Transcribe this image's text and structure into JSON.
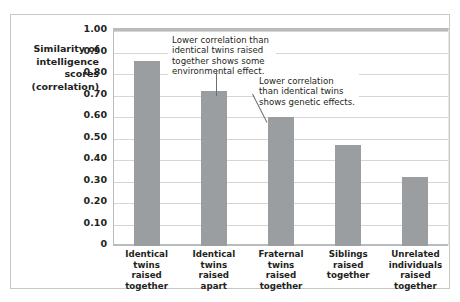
{
  "chart_data": {
    "type": "bar",
    "title": "",
    "subtitle": "",
    "xlabel": "",
    "ylabel": "Similarity of intelligence scores (correlation)",
    "ylabel_lines": [
      "Similarity of",
      "intelligence",
      "scores",
      "(correlation)"
    ],
    "categories": [
      "Identical twins raised together",
      "Identical twins raised apart",
      "Fraternal twins raised together",
      "Siblings raised together",
      "Unrelated individuals raised together"
    ],
    "category_lines": [
      [
        "Identical",
        "twins",
        "raised",
        "together"
      ],
      [
        "Identical",
        "twins",
        "raised",
        "apart"
      ],
      [
        "Fraternal",
        "twins",
        "raised",
        "together"
      ],
      [
        "Siblings",
        "raised",
        "together"
      ],
      [
        "Unrelated",
        "individuals",
        "raised",
        "together"
      ]
    ],
    "values": [
      0.86,
      0.72,
      0.6,
      0.47,
      0.32
    ],
    "ylim": [
      0,
      1.0
    ],
    "ytick_values": [
      1.0,
      0.9,
      0.8,
      0.7,
      0.6,
      0.5,
      0.4,
      0.3,
      0.2,
      0.1,
      0
    ],
    "ytick_labels": [
      "1.00",
      "0.90",
      "0.80",
      "0.70",
      "0.60",
      "0.50",
      "0.40",
      "0.30",
      "0.20",
      "0.10",
      "0"
    ],
    "grid": true,
    "legend": false,
    "bar_color": "#9a9ea1",
    "gridline_color": "#d4d6d8",
    "axis_color": "#b9bcbe",
    "text_color": "#231f20",
    "annotations": [
      {
        "id": "annotation-environmental-effect",
        "text": "Lower correlation than identical twins raised together shows some environmental effect.",
        "lines": [
          "Lower correlation than",
          "identical twins raised",
          "together shows some",
          "environmental effect."
        ],
        "points_to_category": "Identical twins raised apart"
      },
      {
        "id": "annotation-genetic-effects",
        "text": "Lower correlation than identical twins shows genetic effects.",
        "lines": [
          "Lower correlation than",
          "identical twins shows",
          "genetic effects."
        ],
        "points_to_category": "Fraternal twins raised together"
      }
    ]
  }
}
